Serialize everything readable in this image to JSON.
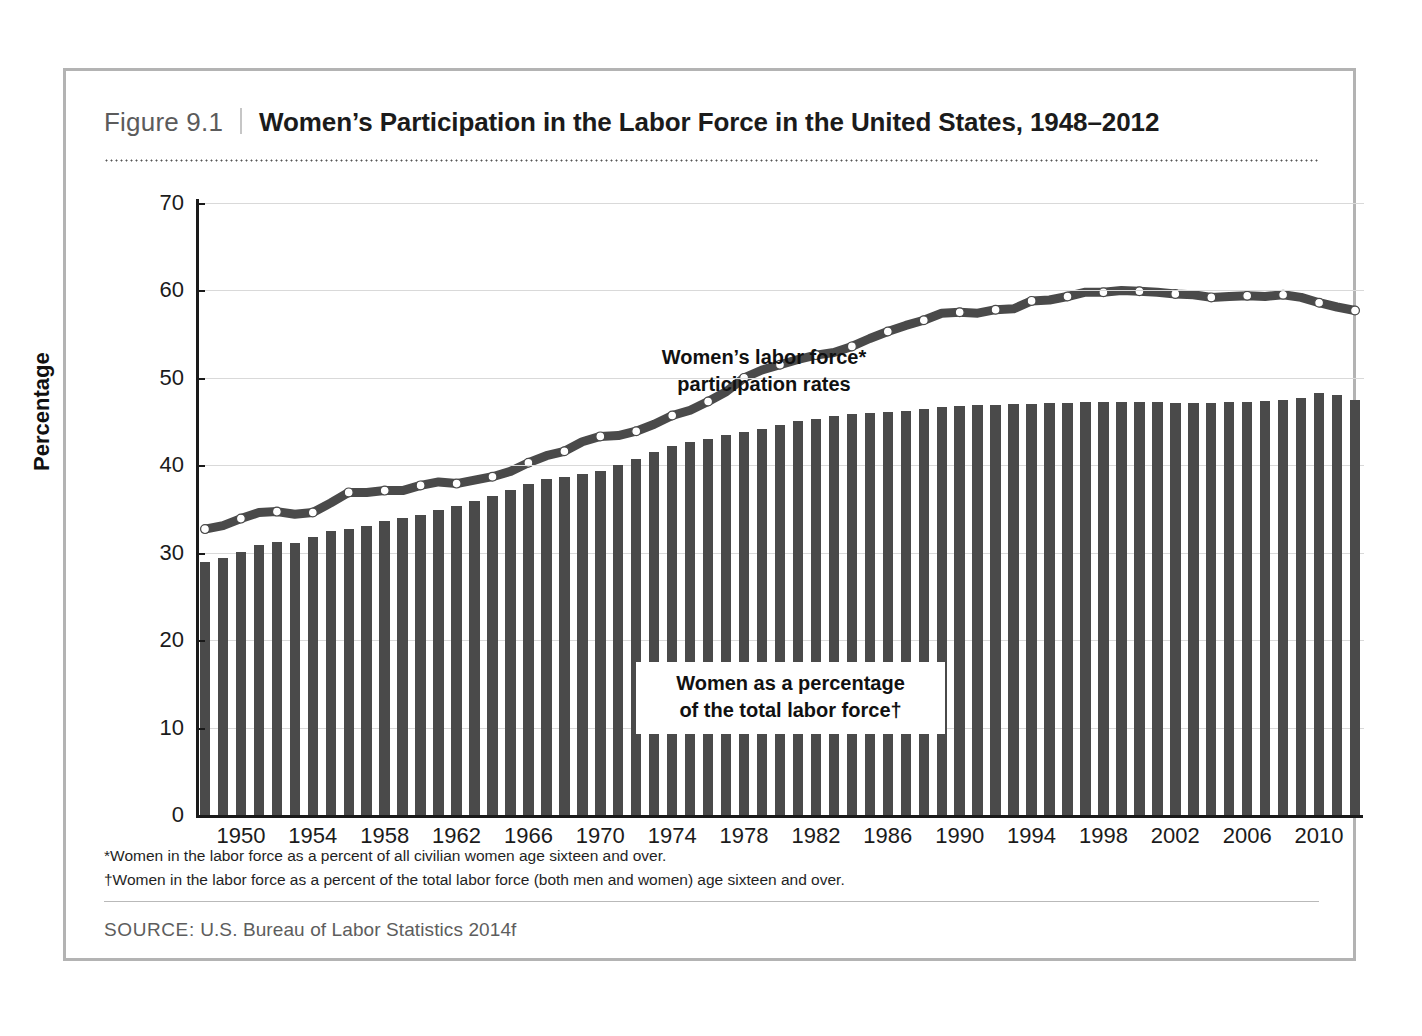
{
  "figure": {
    "number": "Figure 9.1",
    "title": "Women’s Participation in the Labor Force in the United States, 1948–2012"
  },
  "annotations": {
    "line_label_1": "Women’s labor force*",
    "line_label_2": "participation rates",
    "bar_label_1": "Women as a percentage",
    "bar_label_2": "of the total labor force†"
  },
  "footnotes": [
    "*Women in the labor force as a percent of all civilian women age sixteen and over.",
    "†Women in the labor force as a percent of the total labor force (both men and women) age sixteen and over."
  ],
  "source": {
    "label": "SOURCE:",
    "text": " U.S. Bureau of Labor Statistics 2014f"
  },
  "colors": {
    "bar": "#4a4a4a",
    "line": "#4a4a4a",
    "marker_fill": "#ffffff",
    "grid": "#d9d9d9",
    "axis": "#1a1a1a",
    "frame": "#b3b3b3"
  },
  "chart_data": {
    "type": "bar",
    "title": "Women’s Participation in the Labor Force in the United States, 1948–2012",
    "xlabel": "",
    "ylabel": "Percentage",
    "ylim": [
      0,
      70
    ],
    "ytick_labels": [
      "0",
      "10",
      "20",
      "30",
      "40",
      "50",
      "60",
      "70"
    ],
    "yticks": [
      0,
      10,
      20,
      30,
      40,
      50,
      60,
      70
    ],
    "xtick_labels": [
      "1950",
      "1954",
      "1958",
      "1962",
      "1966",
      "1970",
      "1974",
      "1978",
      "1982",
      "1986",
      "1990",
      "1994",
      "1998",
      "2002",
      "2006",
      "2010"
    ],
    "xticks": [
      1950,
      1954,
      1958,
      1962,
      1966,
      1970,
      1974,
      1978,
      1982,
      1986,
      1990,
      1994,
      1998,
      2002,
      2006,
      2010
    ],
    "grid": true,
    "legend_position": "in-plot annotations",
    "x": [
      1948,
      1949,
      1950,
      1951,
      1952,
      1953,
      1954,
      1955,
      1956,
      1957,
      1958,
      1959,
      1960,
      1961,
      1962,
      1963,
      1964,
      1965,
      1966,
      1967,
      1968,
      1969,
      1970,
      1971,
      1972,
      1973,
      1974,
      1975,
      1976,
      1977,
      1978,
      1979,
      1980,
      1981,
      1982,
      1983,
      1984,
      1985,
      1986,
      1987,
      1988,
      1989,
      1990,
      1991,
      1992,
      1993,
      1994,
      1995,
      1996,
      1997,
      1998,
      1999,
      2000,
      2001,
      2002,
      2003,
      2004,
      2005,
      2006,
      2007,
      2008,
      2009,
      2010,
      2011,
      2012
    ],
    "series": [
      {
        "name": "Women as a percentage of the total labor force",
        "type": "bar",
        "values": [
          28.9,
          29.6,
          31.1,
          31.1,
          32.3,
          32.7,
          33.5,
          34.2,
          35.0,
          36.0,
          37.3,
          38.2,
          38.7,
          39.5,
          40.8,
          42.1,
          42.9,
          43.6,
          44.2,
          45.0,
          45.6,
          45.9,
          46.1,
          46.8,
          47.0,
          47.0,
          47.1,
          47.2,
          47.0,
          47.0,
          47.6,
          48.3,
          47.4,
          29.0,
          29.0,
          29.0,
          29.0,
          29.0,
          29.0,
          29.0,
          29.0,
          29.0,
          29.0,
          29.0,
          29.0,
          29.0,
          29.0,
          29.0,
          29.0,
          29.0,
          29.0,
          29.0,
          29.0,
          29.0,
          29.0,
          29.0,
          29.0,
          29.0,
          29.0,
          29.0,
          29.0,
          29.0,
          29.0,
          29.0,
          29.0
        ]
      },
      {
        "name": "Women’s labor force participation rates",
        "type": "line",
        "values": [
          32.7,
          33.1,
          33.9,
          34.6,
          34.7,
          34.4,
          34.6,
          35.7,
          36.9,
          36.9,
          37.1,
          37.1,
          37.7,
          38.1,
          37.9,
          38.3,
          38.7,
          39.3,
          40.3,
          41.1,
          41.6,
          42.7,
          43.3,
          43.4,
          43.9,
          44.7,
          45.7,
          46.3,
          47.3,
          48.4,
          50.0,
          50.9,
          51.5,
          52.1,
          52.6,
          52.9,
          53.6,
          54.5,
          55.3,
          56.0,
          56.6,
          57.4,
          57.5,
          57.4,
          57.8,
          57.9,
          58.8,
          58.9,
          59.3,
          59.8,
          59.8,
          60.0,
          59.9,
          59.8,
          59.6,
          59.5,
          59.2,
          59.3,
          59.4,
          59.3,
          59.5,
          59.2,
          58.6,
          58.1,
          57.7
        ]
      }
    ],
    "notes": [
      "*Women in the labor force as a percent of all civilian women age sixteen and over.",
      "†Women in the labor force as a percent of the total labor force (both men and women) age sixteen and over."
    ],
    "source": "SOURCE: U.S. Bureau of Labor Statistics 2014f"
  }
}
